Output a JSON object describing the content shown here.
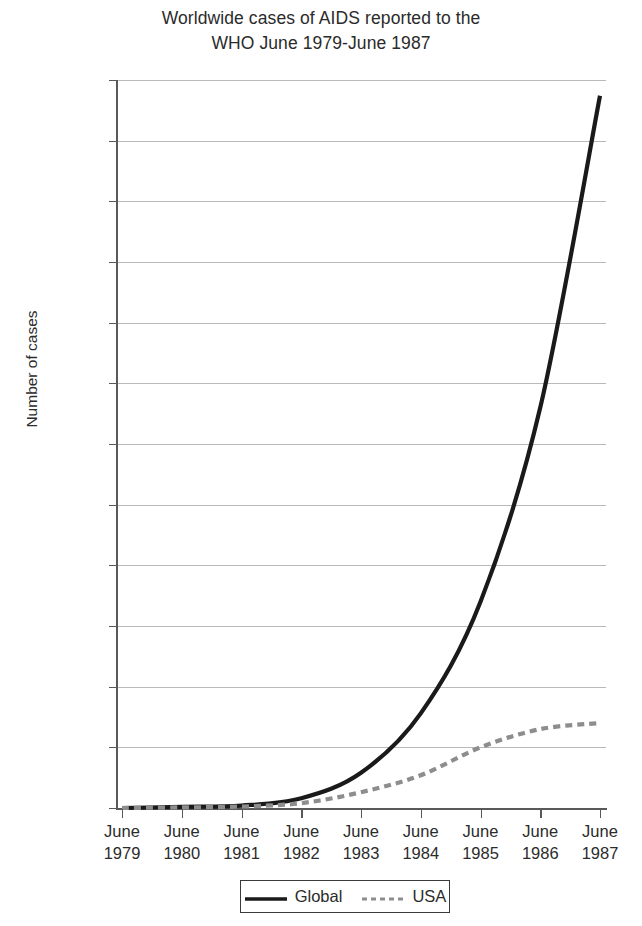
{
  "chart_data": {
    "type": "line",
    "title": "Worldwide cases of AIDS reported to the WHO June 1979-June 1987",
    "title_lines": [
      "Worldwide cases of AIDS reported to the",
      "WHO June 1979-June 1987"
    ],
    "xlabel": "",
    "ylabel": "Number of cases",
    "categories": [
      "June 1979",
      "June 1980",
      "June 1981",
      "June 1982",
      "June 1983",
      "June 1984",
      "June 1985",
      "June 1986",
      "June 1987"
    ],
    "category_lines": [
      [
        "June",
        "1979"
      ],
      [
        "June",
        "1980"
      ],
      [
        "June",
        "1981"
      ],
      [
        "June",
        "1982"
      ],
      [
        "June",
        "1983"
      ],
      [
        "June",
        "1984"
      ],
      [
        "June",
        "1985"
      ],
      [
        "June",
        "1986"
      ],
      [
        "June",
        "1987"
      ]
    ],
    "ylim": [
      0,
      60000
    ],
    "ytick_values": [
      0,
      5000,
      10000,
      15000,
      20000,
      25000,
      30000,
      35000,
      40000,
      45000,
      50000,
      55000,
      60000
    ],
    "ytick_labels": [
      "0",
      "5000",
      "10000",
      "15000",
      "20000",
      "25000",
      "30000",
      "35000",
      "40000",
      "45000",
      "50000",
      "55000",
      "60000"
    ],
    "grid": true,
    "grid_axis": "y",
    "legend_position": "bottom",
    "series": [
      {
        "name": "Global",
        "style": "solid",
        "color": "#1a1a1a",
        "width": 4.2,
        "values": [
          0,
          100,
          200,
          800,
          2900,
          7800,
          17000,
          33000,
          58700
        ]
      },
      {
        "name": "USA",
        "style": "dashed",
        "color": "#8d8d8d",
        "width": 4.2,
        "values": [
          0,
          50,
          120,
          400,
          1300,
          2700,
          5000,
          6500,
          7000
        ]
      }
    ]
  },
  "legend": {
    "entries": [
      {
        "label": "Global"
      },
      {
        "label": "USA"
      }
    ]
  },
  "colors": {
    "global_line": "#1a1a1a",
    "usa_line": "#8d8d8d",
    "gridline": "#b9b9b9",
    "axis": "#58595b",
    "text": "#2b2b2b",
    "background": "#ffffff"
  }
}
